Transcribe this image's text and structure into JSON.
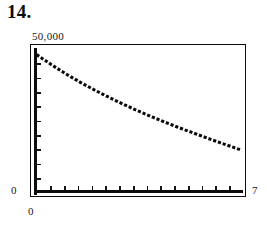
{
  "figure": {
    "number_label": "14."
  },
  "labels": {
    "y_max": "50,000",
    "y_min": "0",
    "x_min": "0",
    "x_max": "7"
  },
  "colors": {
    "ink": "#0d0d0d",
    "curve": "#0a0a0a",
    "background": "#ffffff"
  },
  "chart_data": {
    "type": "line",
    "title": "14.",
    "xlabel": "",
    "ylabel": "",
    "xlim": [
      0,
      7
    ],
    "ylim": [
      0,
      50000
    ],
    "grid": false,
    "legend": null,
    "style": "dotted",
    "x_tick_labels": [
      "0",
      "7"
    ],
    "y_tick_labels": [
      "0",
      "50,000"
    ],
    "x_tick_count": 14,
    "y_tick_count": 9,
    "x": [
      0,
      0.5,
      1,
      1.5,
      2,
      2.5,
      3,
      3.5,
      4,
      4.5,
      5,
      5.5,
      6,
      6.5,
      7
    ],
    "values": [
      48000,
      44500,
      41200,
      38200,
      35400,
      32800,
      30300,
      28000,
      25800,
      23700,
      21700,
      19800,
      17900,
      16100,
      14300
    ]
  }
}
